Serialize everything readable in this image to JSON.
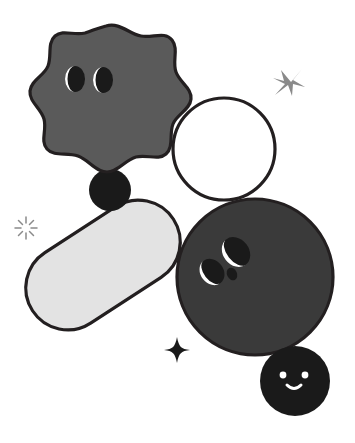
{
  "artwork": {
    "title": "Abstract Character Shapes",
    "background_color": "#ffffff",
    "outline_color": "#231f20",
    "canvas": {
      "width": 355,
      "height": 443
    }
  },
  "palette": {
    "mid_gray": "#5a5a5a",
    "dark_gray": "#3a3a3a",
    "light_gray": "#e3e3e3",
    "black": "#1a1a1a",
    "white": "#ffffff",
    "outline": "#231f20",
    "sparkle_gray": "#8a8a8a"
  },
  "shapes": [
    {
      "id": "blob-character",
      "name": "wavy-blob-character",
      "fill": "#5a5a5a",
      "has_face": true,
      "face": {
        "eyes": 2,
        "eye_style": "crescent-moon",
        "mouth": "smile-curve"
      },
      "center": {
        "x": 107,
        "y": 103
      },
      "approx_size": {
        "width": 148,
        "height": 158
      }
    },
    {
      "id": "black-circle-small-top",
      "name": "black-accent-circle",
      "fill": "#1a1a1a",
      "has_face": false,
      "center": {
        "x": 110,
        "y": 190
      },
      "radius": 21
    },
    {
      "id": "outline-circle",
      "name": "white-outline-circle",
      "fill": "#ffffff",
      "has_face": false,
      "center": {
        "x": 224,
        "y": 149
      },
      "radius": 51
    },
    {
      "id": "capsule",
      "name": "light-gray-capsule",
      "fill": "#e3e3e3",
      "has_face": false,
      "rotation_deg": -33,
      "center": {
        "x": 103,
        "y": 265
      },
      "approx_size": {
        "width": 168,
        "height": 84
      }
    },
    {
      "id": "dark-circle-face",
      "name": "dark-gray-circle-character",
      "fill": "#3a3a3a",
      "has_face": true,
      "face": {
        "eyes": 2,
        "eye_style": "tilted-crescent",
        "mole": true
      },
      "center": {
        "x": 255,
        "y": 277
      },
      "radius": 78
    },
    {
      "id": "black-circle-smiley",
      "name": "black-smiley-circle",
      "fill": "#1a1a1a",
      "has_face": true,
      "face": {
        "eyes": 2,
        "eye_style": "dot",
        "mouth": "smile-curve",
        "color": "#ffffff"
      },
      "center": {
        "x": 295,
        "y": 381
      },
      "radius": 35
    }
  ],
  "sparkles": [
    {
      "id": "sparkle-x",
      "name": "x-cross-sparkle",
      "style": "four-point-cross",
      "color": "#8a8a8a",
      "center": {
        "x": 291,
        "y": 82
      },
      "size": 20
    },
    {
      "id": "sparkle-burst",
      "name": "radial-burst-sparkle",
      "style": "eight-ray-burst",
      "color": "#8a8a8a",
      "center": {
        "x": 26,
        "y": 228
      },
      "size": 18
    },
    {
      "id": "sparkle-star",
      "name": "four-point-star-sparkle",
      "style": "solid-four-point-star",
      "color": "#1a1a1a",
      "center": {
        "x": 177,
        "y": 350
      },
      "size": 19
    }
  ]
}
